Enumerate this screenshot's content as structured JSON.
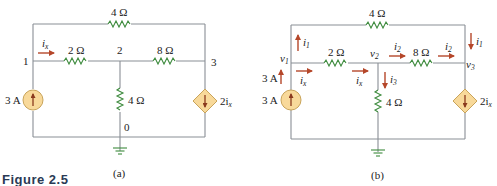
{
  "figure": {
    "label": "Figure 2.5"
  },
  "colors": {
    "wire": "#8a8f96",
    "resistor": "#3c8a3c",
    "current_arrow": "#b5472a",
    "source_fill": "#f8d99a",
    "figure_label": "#2a3a55"
  },
  "circuit_a": {
    "caption": "(a)",
    "top_resistor": "4 Ω",
    "resistor_1_2": "2 Ω",
    "resistor_2_3": "8 Ω",
    "resistor_2_0": "4 Ω",
    "node_1": "1",
    "node_2": "2",
    "node_3": "3",
    "node_0": "0",
    "current_label": "i",
    "current_sub": "x",
    "source_label": "3 A",
    "dep_source_label": "2i",
    "dep_source_sub": "x"
  },
  "circuit_b": {
    "caption": "(b)",
    "top_resistor": "4 Ω",
    "resistor_1_2": "2 Ω",
    "resistor_2_3": "8 Ω",
    "resistor_2_0": "4 Ω",
    "v1": "v",
    "v1_sub": "1",
    "v2": "v",
    "v2_sub": "2",
    "v3": "v",
    "v3_sub": "3",
    "i1_left": "i",
    "i1_left_sub": "1",
    "i1_right": "i",
    "i1_right_sub": "1",
    "i2_a": "i",
    "i2_a_sub": "2",
    "i2_b": "i",
    "i2_b_sub": "2",
    "i3": "i",
    "i3_sub": "3",
    "ix_left": "i",
    "ix_left_sub": "x",
    "ix_mid": "i",
    "ix_mid_sub": "x",
    "arrow_3a_label": "3 A",
    "source_label": "3 A",
    "dep_source_label": "2i",
    "dep_source_sub": "x"
  }
}
